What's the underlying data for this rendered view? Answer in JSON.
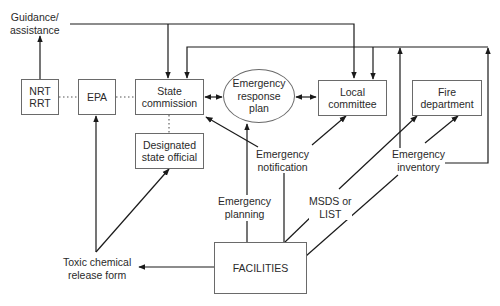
{
  "nodes": {
    "nrt_rrt": "NRT\nRRT",
    "epa": "EPA",
    "state_commission": "State\ncommission",
    "emergency_response_plan": "Emergency\nresponse\nplan",
    "local_committee": "Local\ncommittee",
    "fire_department": "Fire\ndepartment",
    "designated_state_official": "Designated\nstate official",
    "facilities": "FACILITIES"
  },
  "labels": {
    "guidance_assistance": "Guidance/\nassistance",
    "emergency_notification": "Emergency\nnotification",
    "emergency_planning": "Emergency\nplanning",
    "msds_or_list": "MSDS or\nLIST",
    "emergency_inventory": "Emergency\ninventory",
    "toxic_chemical_release_form": "Toxic chemical\nrelease form"
  },
  "edges": [
    {
      "from": "NRT/RRT",
      "to": "Guidance/assistance",
      "style": "arrow"
    },
    {
      "from": "Guidance/assistance",
      "to": "State commission",
      "style": "arrow"
    },
    {
      "from": "Guidance/assistance",
      "to": "Local committee",
      "style": "arrow"
    },
    {
      "from": "NRT/RRT",
      "to": "EPA",
      "style": "dotted"
    },
    {
      "from": "EPA",
      "to": "State commission",
      "style": "dotted"
    },
    {
      "from": "State commission",
      "to": "Designated state official",
      "style": "dotted"
    },
    {
      "from": "State commission",
      "to": "Emergency response plan",
      "style": "bidirectional"
    },
    {
      "from": "Emergency response plan",
      "to": "Local committee",
      "style": "bidirectional"
    },
    {
      "from": "Emergency notification",
      "to": "State commission",
      "style": "arrow"
    },
    {
      "from": "Emergency notification",
      "to": "Local committee",
      "style": "arrow"
    },
    {
      "from": "FACILITIES",
      "to": "Emergency notification",
      "style": "line"
    },
    {
      "from": "FACILITIES",
      "to": "Emergency response plan",
      "label": "Emergency planning",
      "style": "arrow"
    },
    {
      "from": "FACILITIES",
      "to": "Fire department",
      "label": "MSDS or LIST",
      "style": "arrow"
    },
    {
      "from": "FACILITIES",
      "to": "Fire department",
      "label": "Emergency inventory",
      "style": "arrow"
    },
    {
      "from": "Emergency inventory",
      "to": "State commission / Local committee",
      "style": "arrow"
    },
    {
      "from": "MSDS or LIST",
      "to": "State commission / Local committee",
      "style": "arrow"
    },
    {
      "from": "FACILITIES",
      "to": "Toxic chemical release form",
      "style": "arrow"
    },
    {
      "from": "Toxic chemical release form",
      "to": "EPA",
      "style": "arrow"
    },
    {
      "from": "Toxic chemical release form",
      "to": "Designated state official",
      "style": "arrow"
    }
  ],
  "colors": {
    "line": "#1a1a1a",
    "box_border": "#6a6a6a",
    "text": "#2a2a2a",
    "background": "#ffffff"
  }
}
